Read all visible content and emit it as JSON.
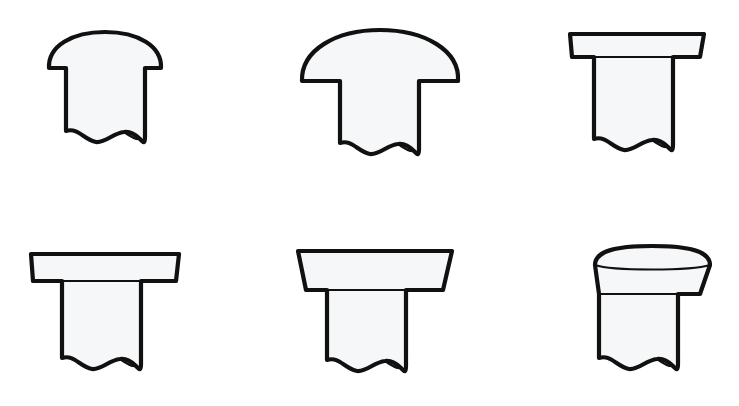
{
  "figure": {
    "background_color": "#ffffff",
    "body_fill_color": "#f6f7f9",
    "outline_color": "#111111",
    "outline_width_px": 4.2,
    "seam_width_px": 2.2,
    "rows": 2,
    "columns": 3,
    "item_count": 6
  },
  "items": [
    {
      "index": 1,
      "position": "top-left",
      "name": "round-head",
      "head_style": "domed",
      "description": "High round dome head on a straight shank with broken-off end",
      "outline_path": "M 66 68 L 66 131 C 78 127 84 140 96 142 C 106 143 113 133 124 132 C 131 131 136 135 140 139 C 143 142 145 145 145 137 L 145 68 L 161 68 C 162 46 138 32 105 32 C 72 32 48 46 49 68 Z",
      "seam_path": "M 140 139 C 134 133 131 131 124 132 C 131 137 136 140 140 139 Z"
    },
    {
      "index": 2,
      "position": "top-center",
      "name": "wide-round-head",
      "head_style": "domed-wide",
      "description": "Low wide dome head with large overhang on a straight shank",
      "outline_path": "M 340 81 L 340 143 C 352 139 358 152 370 154 C 380 155 387 145 398 144 C 405 143 410 147 414 151 C 417 154 419 157 419 149 L 419 81 L 458 81 C 460 50 424 30 380 30 C 336 30 301 50 302 81 Z",
      "seam_path": "M 414 151 C 408 145 405 143 398 144 C 405 149 410 152 414 151 Z"
    },
    {
      "index": 3,
      "position": "top-right",
      "name": "flush-countersunk-head-shallow",
      "head_style": "countersunk-shallow",
      "description": "Flat flush countersunk head with a shallow conical underside",
      "outline_path": "M 594 57 L 594 139 C 606 135 612 148 624 150 C 634 151 641 141 652 140 C 659 139 664 143 668 147 C 671 150 673 153 673 145 L 673 57 L 700 57 L 704 34 L 570 34 L 572 57 Z",
      "seam_path": "M 594 57 L 673 57 M 668 147 C 662 141 659 139 652 140 C 659 145 664 148 668 147 Z"
    },
    {
      "index": 4,
      "position": "bottom-left",
      "name": "countersunk-head-100-degree",
      "head_style": "countersunk-medium",
      "description": "Countersunk head with a 100 degree conical underside on a straight shank",
      "outline_path": "M 62 281 L 62 358 C 74 354 80 367 92 369 C 102 370 109 360 120 359 C 127 358 132 362 136 366 C 139 369 141 372 141 364 L 141 281 L 176 281 L 179 254 L 31 254 L 33 281 Z",
      "seam_path": "M 62 281 L 141 281 M 136 366 C 130 360 127 358 120 359 C 127 364 132 367 136 366 Z"
    },
    {
      "index": 5,
      "position": "bottom-center",
      "name": "countersunk-head-82-degree",
      "head_style": "countersunk-deep",
      "description": "Deep countersunk head with a steep conical underside on a straight shank",
      "outline_path": "M 327 290 L 327 360 C 339 356 345 369 357 371 C 367 372 374 362 385 361 C 392 360 397 364 401 368 C 404 371 406 374 406 366 L 406 290 L 443 290 L 452 251 L 298 251 L 306 290 Z",
      "seam_path": "M 327 290 L 406 290 M 401 368 C 395 362 392 360 385 361 C 392 366 397 369 401 368 Z"
    },
    {
      "index": 6,
      "position": "bottom-right",
      "name": "oval-countersunk-head",
      "head_style": "oval-lens-countersunk",
      "description": "Oval lens top over a countersunk cone on a straight shank",
      "outline_path": "M 599 294 L 599 358 C 611 354 617 367 629 369 C 639 370 646 360 657 359 C 664 358 669 362 673 366 C 676 369 678 372 678 364 L 678 294 L 700 294 L 710 265 C 710 251 689 246 652 246 C 615 246 595 251 595 265 Z",
      "seam_path": "M 599 294 L 678 294 M 595 265 C 612 271 691 271 710 265 M 673 366 C 667 360 664 358 657 359 C 664 364 669 367 673 366 Z"
    }
  ]
}
